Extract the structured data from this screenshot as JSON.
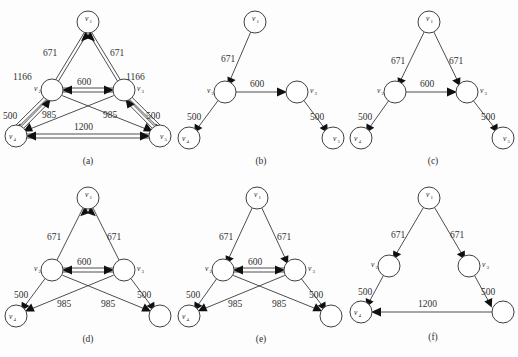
{
  "figure": {
    "background_color": "#fdfdfd",
    "node_stroke_color": "#404040",
    "edge_stroke_color": "#3a3a3a",
    "arrow_fill_color": "#101010",
    "text_color": "#303030"
  },
  "panels": [
    {
      "id": "panel-a",
      "caption": "(a)",
      "nodes": [
        {
          "id": "v1",
          "label": "v",
          "sub": "1",
          "label_pos": "inside"
        },
        {
          "id": "v2",
          "label": "v",
          "sub": "2",
          "label_pos": "left"
        },
        {
          "id": "v3",
          "label": "v",
          "sub": "3",
          "label_pos": "right"
        },
        {
          "id": "v4",
          "label": "v",
          "sub": "4",
          "label_pos": "inside"
        },
        {
          "id": "v5",
          "label": "v",
          "sub": "5",
          "label_pos": "inside"
        }
      ],
      "edges": [
        {
          "from": "v2",
          "to": "v1",
          "weight": "671",
          "double": true
        },
        {
          "from": "v3",
          "to": "v1",
          "weight": "671",
          "double": true
        },
        {
          "from": "v4",
          "to": "v2",
          "weight": "1166",
          "double": true
        },
        {
          "from": "v5",
          "to": "v3",
          "weight": "1166",
          "double": true
        },
        {
          "from": "v2",
          "to": "v3",
          "weight": "600",
          "double": true
        },
        {
          "from": "v4",
          "to": "v2",
          "weight": "500",
          "double": true
        },
        {
          "from": "v5",
          "to": "v3",
          "weight": "500",
          "double": true
        },
        {
          "from": "v3",
          "to": "v4",
          "weight": "985",
          "double": false
        },
        {
          "from": "v2",
          "to": "v5",
          "weight": "985",
          "double": false
        },
        {
          "from": "v4",
          "to": "v5",
          "weight": "1200",
          "double": true
        }
      ]
    },
    {
      "id": "panel-b",
      "caption": "(b)",
      "nodes": [
        {
          "id": "v1",
          "label": "v",
          "sub": "1",
          "label_pos": "inside"
        },
        {
          "id": "v2",
          "label": "v",
          "sub": "2",
          "label_pos": "left"
        },
        {
          "id": "v3",
          "label": "v",
          "sub": "3",
          "label_pos": "right"
        },
        {
          "id": "v4",
          "label": "v",
          "sub": "4",
          "label_pos": "inside"
        },
        {
          "id": "v5",
          "label": "v",
          "sub": "5",
          "label_pos": "inside"
        }
      ],
      "edges": [
        {
          "from": "v1",
          "to": "v2",
          "weight": "671",
          "double": false
        },
        {
          "from": "v2",
          "to": "v3",
          "weight": "600",
          "double": false
        },
        {
          "from": "v2",
          "to": "v4",
          "weight": "500",
          "double": false
        },
        {
          "from": "v3",
          "to": "v5",
          "weight": "500",
          "double": false
        }
      ]
    },
    {
      "id": "panel-c",
      "caption": "(c)",
      "nodes": [
        {
          "id": "v1",
          "label": "v",
          "sub": "1",
          "label_pos": "inside"
        },
        {
          "id": "v2",
          "label": "v",
          "sub": "2",
          "label_pos": "left"
        },
        {
          "id": "v3",
          "label": "v",
          "sub": "3",
          "label_pos": "right"
        },
        {
          "id": "v4",
          "label": "v",
          "sub": "4",
          "label_pos": "inside"
        },
        {
          "id": "v5",
          "label": "v",
          "sub": "5",
          "label_pos": "inside"
        }
      ],
      "edges": [
        {
          "from": "v1",
          "to": "v2",
          "weight": "671",
          "double": false
        },
        {
          "from": "v1",
          "to": "v3",
          "weight": "671",
          "double": false
        },
        {
          "from": "v2",
          "to": "v3",
          "weight": "600",
          "double": false
        },
        {
          "from": "v2",
          "to": "v4",
          "weight": "500",
          "double": false
        },
        {
          "from": "v3",
          "to": "v5",
          "weight": "500",
          "double": false
        }
      ]
    },
    {
      "id": "panel-d",
      "caption": "(d)",
      "nodes": [
        {
          "id": "v1",
          "label": "v",
          "sub": "1",
          "label_pos": "inside"
        },
        {
          "id": "v2",
          "label": "v",
          "sub": "2",
          "label_pos": "left"
        },
        {
          "id": "v3",
          "label": "v",
          "sub": "3",
          "label_pos": "right"
        },
        {
          "id": "v4",
          "label": "v",
          "sub": "4",
          "label_pos": "inside"
        },
        {
          "id": "v5",
          "label": "",
          "sub": "",
          "label_pos": "none"
        }
      ],
      "edges": [
        {
          "from": "v1",
          "to": "v2",
          "weight": "671",
          "double": false
        },
        {
          "from": "v1",
          "to": "v3",
          "weight": "671",
          "double": false
        },
        {
          "from": "v2",
          "to": "v3",
          "weight": "600",
          "double": true
        },
        {
          "from": "v2",
          "to": "v4",
          "weight": "500",
          "double": false
        },
        {
          "from": "v3",
          "to": "v5",
          "weight": "500",
          "double": false
        },
        {
          "from": "v3",
          "to": "v4",
          "weight": "985",
          "double": false
        },
        {
          "from": "v2",
          "to": "v5",
          "weight": "985",
          "double": false
        }
      ]
    },
    {
      "id": "panel-e",
      "caption": "(e)",
      "nodes": [
        {
          "id": "v1",
          "label": "v",
          "sub": "1",
          "label_pos": "inside"
        },
        {
          "id": "v2",
          "label": "v",
          "sub": "2",
          "label_pos": "left"
        },
        {
          "id": "v3",
          "label": "v",
          "sub": "3",
          "label_pos": "right"
        },
        {
          "id": "v4",
          "label": "v",
          "sub": "4",
          "label_pos": "inside"
        },
        {
          "id": "v5",
          "label": "",
          "sub": "",
          "label_pos": "none"
        }
      ],
      "edges": [
        {
          "from": "v1",
          "to": "v2",
          "weight": "671",
          "double": false
        },
        {
          "from": "v1",
          "to": "v3",
          "weight": "671",
          "double": false
        },
        {
          "from": "v2",
          "to": "v3",
          "weight": "600",
          "double": true
        },
        {
          "from": "v2",
          "to": "v4",
          "weight": "500",
          "double": false
        },
        {
          "from": "v3",
          "to": "v5",
          "weight": "500",
          "double": false
        },
        {
          "from": "v3",
          "to": "v4",
          "weight": "985",
          "double": false
        },
        {
          "from": "v2",
          "to": "v5",
          "weight": "985",
          "double": false
        }
      ]
    },
    {
      "id": "panel-f",
      "caption": "(f)",
      "nodes": [
        {
          "id": "v1",
          "label": "v",
          "sub": "1",
          "label_pos": "inside"
        },
        {
          "id": "v2",
          "label": "v",
          "sub": "2",
          "label_pos": "left"
        },
        {
          "id": "v3",
          "label": "v",
          "sub": "3",
          "label_pos": "right"
        },
        {
          "id": "v4",
          "label": "v",
          "sub": "4",
          "label_pos": "inside"
        },
        {
          "id": "v5",
          "label": "",
          "sub": "",
          "label_pos": "none"
        }
      ],
      "edges": [
        {
          "from": "v1",
          "to": "v2",
          "weight": "671",
          "double": false
        },
        {
          "from": "v1",
          "to": "v3",
          "weight": "671",
          "double": false
        },
        {
          "from": "v2",
          "to": "v4",
          "weight": "500",
          "double": false
        },
        {
          "from": "v3",
          "to": "v5",
          "weight": "500",
          "double": false
        },
        {
          "from": "v5",
          "to": "v4",
          "weight": "1200",
          "double": false
        }
      ]
    }
  ],
  "labels": {
    "a": {
      "caption": "(a)",
      "v1": "v",
      "v1s": "1",
      "v2": "v",
      "v2s": "2",
      "v3": "v",
      "v3s": "3",
      "v4": "v",
      "v4s": "4",
      "v5": "v",
      "v5s": "5",
      "w_671_left": "671",
      "w_671_right": "671",
      "w_1166_left": "1166",
      "w_1166_right": "1166",
      "w_600": "600",
      "w_500_left": "500",
      "w_500_right": "500",
      "w_985_left": "985",
      "w_985_right": "985",
      "w_1200": "1200"
    },
    "b": {
      "caption": "(b)",
      "v1": "v",
      "v1s": "1",
      "v2": "v",
      "v2s": "2",
      "v3": "v",
      "v3s": "3",
      "v4": "v",
      "v4s": "4",
      "v5": "v",
      "v5s": "5",
      "w_671": "671",
      "w_600": "600",
      "w_500_left": "500",
      "w_500_right": "500"
    },
    "c": {
      "caption": "(c)",
      "v1": "v",
      "v1s": "1",
      "v2": "v",
      "v2s": "2",
      "v3": "v",
      "v3s": "3",
      "v4": "v",
      "v4s": "4",
      "v5": "v",
      "v5s": "5",
      "w_671_left": "671",
      "w_671_right": "671",
      "w_600": "600",
      "w_500_left": "500",
      "w_500_right": "500"
    },
    "d": {
      "caption": "(d)",
      "v1": "v",
      "v1s": "1",
      "v2": "v",
      "v2s": "2",
      "v3": "v",
      "v3s": "3",
      "v4": "v",
      "v4s": "4",
      "w_671_left": "671",
      "w_671_right": "671",
      "w_600": "600",
      "w_500_left": "500",
      "w_500_right": "500",
      "w_985_left": "985",
      "w_985_right": "985"
    },
    "e": {
      "caption": "(e)",
      "v1": "v",
      "v1s": "1",
      "v2": "v",
      "v2s": "2",
      "v3": "v",
      "v3s": "3",
      "v4": "v",
      "v4s": "4",
      "w_671_left": "671",
      "w_671_right": "671",
      "w_600": "600",
      "w_500_left": "500",
      "w_500_right": "500",
      "w_985_left": "985",
      "w_985_right": "985"
    },
    "f": {
      "caption": "(f)",
      "v1": "v",
      "v1s": "1",
      "v2": "v",
      "v2s": "2",
      "v3": "v",
      "v3s": "3",
      "v4": "v",
      "v4s": "4",
      "w_671_left": "671",
      "w_671_right": "671",
      "w_500_left": "500",
      "w_500_right": "500",
      "w_1200": "1200"
    }
  }
}
